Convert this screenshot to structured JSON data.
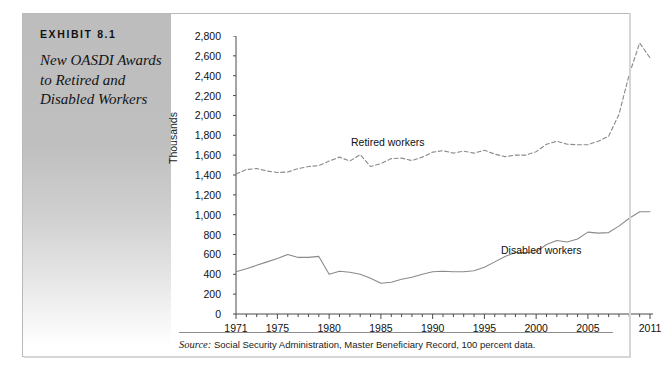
{
  "exhibit": {
    "label": "EXHIBIT 8.1",
    "title": "New OASDI Awards to Retired and Disabled Workers"
  },
  "source": {
    "keyword": "Source:",
    "text": " Social Security Administration, Master Beneficiary Record, 100 percent data."
  },
  "annotations": {
    "retired": "Retired workers",
    "disabled": "Disabled workers"
  },
  "chart_data": {
    "type": "line",
    "title": "New OASDI Awards to Retired and Disabled Workers",
    "xlabel": "",
    "ylabel": "Thousands",
    "xlim": [
      1971,
      2011
    ],
    "ylim": [
      0,
      2800
    ],
    "ytick_labels": [
      "2,800",
      "2,600",
      "2,400",
      "2,200",
      "2,000",
      "1,800",
      "1,600",
      "1,400",
      "1,200",
      "1,000",
      "800",
      "600",
      "400",
      "200",
      "0"
    ],
    "ytick_values": [
      2800,
      2600,
      2400,
      2200,
      2000,
      1800,
      1600,
      1400,
      1200,
      1000,
      800,
      600,
      400,
      200,
      0
    ],
    "xtick_labels": [
      "1971",
      "1975",
      "1980",
      "1985",
      "1990",
      "1995",
      "2000",
      "2005",
      "2011"
    ],
    "xtick_values": [
      1971,
      1975,
      1980,
      1985,
      1990,
      1995,
      2000,
      2005,
      2011
    ],
    "grid": false,
    "legend": "inline-annotation",
    "x": [
      1971,
      1972,
      1973,
      1974,
      1975,
      1976,
      1977,
      1978,
      1979,
      1980,
      1981,
      1982,
      1983,
      1984,
      1985,
      1986,
      1987,
      1988,
      1989,
      1990,
      1991,
      1992,
      1993,
      1994,
      1995,
      1996,
      1997,
      1998,
      1999,
      2000,
      2001,
      2002,
      2003,
      2004,
      2005,
      2006,
      2007,
      2008,
      2009,
      2010,
      2011
    ],
    "series": [
      {
        "name": "Retired workers",
        "style": "dashed",
        "color": "#8a8a8a",
        "values": [
          1410,
          1455,
          1465,
          1440,
          1425,
          1430,
          1465,
          1485,
          1495,
          1540,
          1580,
          1540,
          1605,
          1485,
          1515,
          1565,
          1570,
          1545,
          1580,
          1630,
          1645,
          1620,
          1640,
          1620,
          1650,
          1610,
          1585,
          1600,
          1600,
          1635,
          1710,
          1740,
          1710,
          1705,
          1705,
          1740,
          1790,
          2010,
          2415,
          2730,
          2580
        ]
      },
      {
        "name": "Disabled workers",
        "style": "solid",
        "color": "#8a8a8a",
        "values": [
          425,
          455,
          490,
          525,
          560,
          600,
          570,
          570,
          580,
          400,
          430,
          420,
          400,
          360,
          310,
          320,
          350,
          370,
          400,
          425,
          430,
          425,
          425,
          435,
          470,
          525,
          580,
          620,
          620,
          625,
          700,
          740,
          725,
          755,
          825,
          815,
          820,
          885,
          965,
          1030,
          1030
        ]
      }
    ]
  }
}
